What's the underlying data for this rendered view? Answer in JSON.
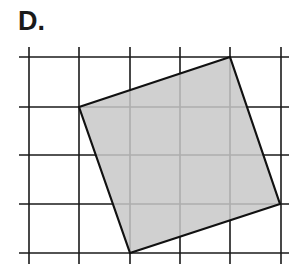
{
  "label": "D.",
  "grid": {
    "vertical_x": [
      29,
      79,
      130,
      180,
      230,
      281
    ],
    "horizontal_y": [
      57,
      107,
      155,
      204,
      253
    ],
    "x_extent": [
      19,
      289
    ],
    "y_extent": [
      47,
      264
    ],
    "line_color": "#1a1a1a"
  },
  "shape": {
    "type": "square",
    "vertices": [
      [
        230,
        57
      ],
      [
        280,
        204
      ],
      [
        130,
        253
      ],
      [
        79,
        107
      ]
    ],
    "fill": "#c8c8c8",
    "stroke": "#111111"
  }
}
